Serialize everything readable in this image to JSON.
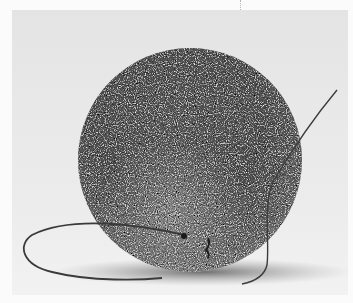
{
  "image": {
    "subject": "textured dark sphere with thin wire",
    "alt": "Close-up photograph of a fuzzy, granular grey sphere resting on a white surface with a thin curved wire looping around it",
    "background_color": "#e8e8e8",
    "sphere_color": "#5a5a5a",
    "highlight_color": "#bdbdbd",
    "wire_color": "#3a3a3a"
  }
}
